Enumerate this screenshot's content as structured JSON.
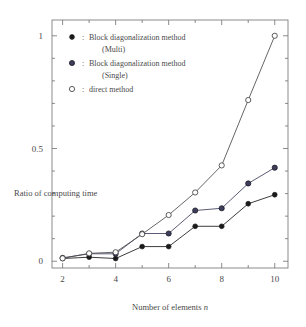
{
  "chart_data": {
    "type": "line",
    "title": "",
    "subtitle": "",
    "xlabel": "Number of elements n",
    "ylabel": "Ratio of computing time",
    "x": [
      2,
      3,
      4,
      5,
      6,
      7,
      8,
      9,
      10
    ],
    "xlim": [
      1.6,
      10.5
    ],
    "ylim": [
      -0.03,
      1.07
    ],
    "xticks": [
      2,
      4,
      6,
      8,
      10
    ],
    "xticks_labels": [
      "2",
      "4",
      "6",
      "8",
      "10"
    ],
    "xticks_minor": [
      3,
      5,
      7,
      9
    ],
    "yticks": [
      0,
      0.5,
      1
    ],
    "yticks_labels": [
      "0",
      "0.5",
      "1"
    ],
    "yticks_minor": [
      0.1,
      0.2,
      0.3,
      0.4,
      0.6,
      0.7,
      0.8,
      0.9
    ],
    "grid": false,
    "legend_position": "upper-left",
    "series": [
      {
        "name": "Block diagonalization method (Multi)",
        "marker": "filled-circle",
        "color": "#1a1a1a",
        "values": [
          0.012,
          0.018,
          0.012,
          0.065,
          0.065,
          0.155,
          0.155,
          0.255,
          0.295
        ]
      },
      {
        "name": "Block diagonalization method (Single)",
        "marker": "filled-circle-gray",
        "color": "#3d3d5c",
        "values": [
          0.015,
          0.033,
          0.033,
          0.123,
          0.123,
          0.225,
          0.235,
          0.345,
          0.415
        ]
      },
      {
        "name": "direct method",
        "marker": "open-circle",
        "color": "#4a4a4a",
        "values": [
          0.013,
          0.035,
          0.04,
          0.12,
          0.205,
          0.305,
          0.425,
          0.715,
          1.0
        ]
      }
    ]
  },
  "axis": {
    "ylabel": "Ratio of computing time",
    "xlabel_prefix": "Number of elements ",
    "xlabel_symbol": "n"
  },
  "legend": {
    "entries": [
      {
        "marker": "filled-circle",
        "separator": ":",
        "line1": "Block diagonalization method",
        "line2": "(Multi)"
      },
      {
        "marker": "filled-circle-gray",
        "separator": ":",
        "line1": "Block diagonalization method",
        "line2": "(Single)"
      },
      {
        "marker": "open-circle",
        "separator": ":",
        "line1": "direct method",
        "line2": ""
      }
    ]
  },
  "colors": {
    "frame": "#6f6f6f",
    "text": "#4a4a4a",
    "multi": "#1a1a1a",
    "single": "#3d3d5c",
    "direct": "#4a4a4a",
    "background": "#ffffff"
  }
}
